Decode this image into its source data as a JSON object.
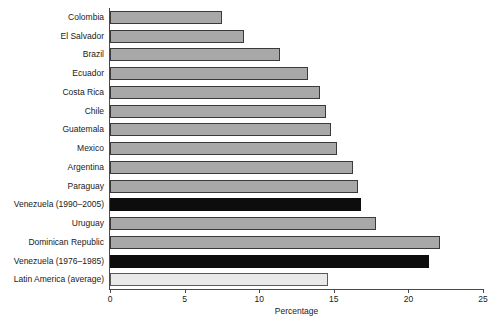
{
  "chart_data": {
    "type": "bar",
    "orientation": "horizontal",
    "title": "",
    "xlabel": "Percentage",
    "ylabel": "",
    "xlim": [
      0,
      25
    ],
    "xticks": [
      0,
      5,
      10,
      15,
      20,
      25
    ],
    "grid": false,
    "legend": "none",
    "categories": [
      "Colombia",
      "El Salvador",
      "Brazil",
      "Ecuador",
      "Costa Rica",
      "Chile",
      "Guatemala",
      "Mexico",
      "Argentina",
      "Paraguay",
      "Venezuela (1990–2005)",
      "Uruguay",
      "Dominican Republic",
      "Venezuela (1976–1985)",
      "Latin America (average)"
    ],
    "values": [
      7.5,
      9.0,
      11.4,
      13.3,
      14.1,
      14.5,
      14.8,
      15.2,
      16.3,
      16.6,
      16.8,
      17.8,
      22.1,
      21.4,
      14.6
    ],
    "bar_styles": [
      "normal",
      "normal",
      "normal",
      "normal",
      "normal",
      "normal",
      "normal",
      "normal",
      "normal",
      "normal",
      "highlight",
      "normal",
      "normal",
      "highlight",
      "average"
    ],
    "colors": {
      "normal_fill": "#a8a8a8",
      "highlight_fill": "#0d0d0d",
      "average_fill": "#e9e9e9",
      "bar_border": "#3a3a3a",
      "axis": "#4a4a4a",
      "text": "#1a1a1a",
      "background": "#ffffff"
    }
  }
}
